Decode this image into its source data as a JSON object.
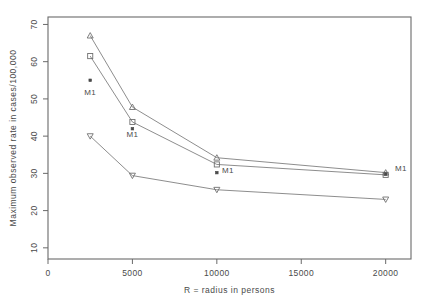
{
  "chart_data": {
    "type": "line",
    "title": "",
    "subtitle": "",
    "xlabel": "R = radius in persons",
    "ylabel": "Maximum observed rate in cases/100,000",
    "xlim": [
      0,
      21500
    ],
    "ylim": [
      7,
      72
    ],
    "xticks": [
      0,
      5000,
      10000,
      15000,
      20000
    ],
    "xticklabels": [
      "0",
      "5000",
      "10000",
      "15000",
      "20000"
    ],
    "yticks": [
      10,
      20,
      30,
      40,
      50,
      60,
      70
    ],
    "yticklabels": [
      "10",
      "20",
      "30",
      "40",
      "50",
      "60",
      "70"
    ],
    "grid": false,
    "legend_position": "none",
    "x": [
      2500,
      5000,
      10000,
      20000
    ],
    "series": [
      {
        "name": "triangle-up",
        "marker": "triangle-up",
        "filled": false,
        "values": [
          67.0,
          47.8,
          34.2,
          30.2
        ]
      },
      {
        "name": "square",
        "marker": "square",
        "filled": false,
        "values": [
          61.5,
          43.8,
          32.4,
          29.6
        ]
      },
      {
        "name": "M1",
        "marker": "dot",
        "filled": true,
        "connected": false,
        "values": [
          55.0,
          42.0,
          30.2,
          29.8
        ]
      },
      {
        "name": "triangle-down",
        "marker": "triangle-down",
        "filled": false,
        "values": [
          40.0,
          29.4,
          25.6,
          23.0
        ]
      }
    ],
    "annotations": [
      {
        "text": "M1",
        "x": 2500,
        "y": 51.0
      },
      {
        "text": "M1",
        "x": 5000,
        "y": 39.8
      },
      {
        "text": "M1",
        "x": 10650,
        "y": 30.2
      },
      {
        "text": "M1",
        "x": 20900,
        "y": 30.6
      }
    ]
  },
  "colors": {
    "background": "#ffffff",
    "axis": "#6a6a6a",
    "line": "#808080",
    "marker": "#707070",
    "text": "#4a4a4a"
  }
}
